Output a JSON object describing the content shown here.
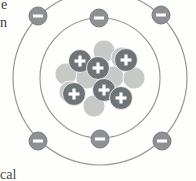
{
  "diagram": {
    "name": "bohr-atom-model",
    "background": "#fefefd",
    "orbit_color": "#979797",
    "center": {
      "x": 100,
      "y": 78
    },
    "orbits": [
      {
        "name": "inner-shell",
        "r": 60
      },
      {
        "name": "outer-shell",
        "r": 87
      }
    ],
    "particles": {
      "electron": {
        "symbol": "-",
        "symbol_color": "#ffffff",
        "color": "#8d9194",
        "rim_color": "#797d80",
        "r": 9
      },
      "proton": {
        "symbol": "+",
        "symbol_color": "#ffffff",
        "color": "#6f7477",
        "r": 11.5
      },
      "neutron": {
        "symbol": "",
        "color": "#c7c9c7",
        "r": 11
      }
    },
    "counts": {
      "electrons": 6,
      "protons": 6,
      "neutrons": 8
    },
    "electrons": [
      {
        "x": 38,
        "y": 16,
        "shell": "outer"
      },
      {
        "x": 99,
        "y": 18,
        "shell": "inner"
      },
      {
        "x": 161,
        "y": 15,
        "shell": "outer"
      },
      {
        "x": 38,
        "y": 141,
        "shell": "outer"
      },
      {
        "x": 100,
        "y": 139,
        "shell": "inner"
      },
      {
        "x": 162,
        "y": 141,
        "shell": "outer"
      }
    ],
    "neutrons": [
      {
        "x": 104,
        "y": 51
      },
      {
        "x": 122,
        "y": 58
      },
      {
        "x": 66,
        "y": 74
      },
      {
        "x": 87,
        "y": 78
      },
      {
        "x": 113,
        "y": 77
      },
      {
        "x": 134,
        "y": 78
      },
      {
        "x": 70,
        "y": 92
      },
      {
        "x": 94,
        "y": 106
      }
    ],
    "protons": [
      {
        "x": 80,
        "y": 61
      },
      {
        "x": 98,
        "y": 68
      },
      {
        "x": 126,
        "y": 60
      },
      {
        "x": 74,
        "y": 94
      },
      {
        "x": 104,
        "y": 90
      },
      {
        "x": 121,
        "y": 98
      }
    ]
  },
  "page_text": {
    "fragment_top_1": "e",
    "fragment_top_2": "n",
    "fragment_bottom": "cal"
  }
}
